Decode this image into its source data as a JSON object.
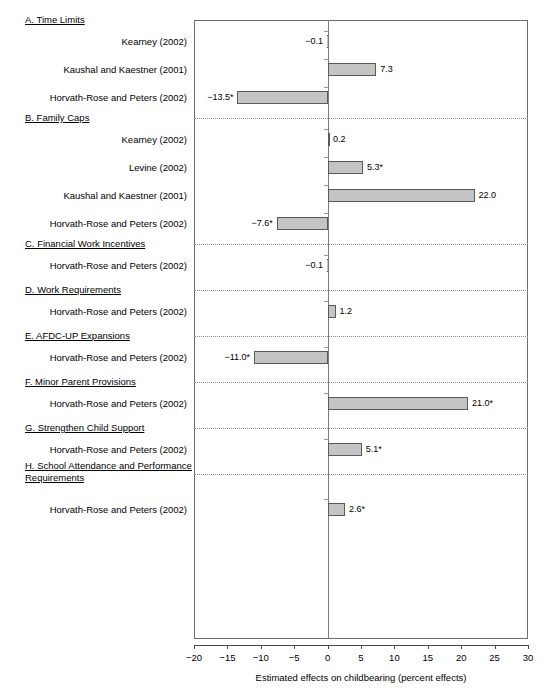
{
  "chart_data": {
    "type": "bar",
    "orientation": "horizontal",
    "title": "",
    "xlabel": "Estimated effects on childbearing (percent effects)",
    "ylabel": "",
    "xlim": [
      -20,
      30
    ],
    "xticks": [
      -20,
      -15,
      -10,
      -5,
      0,
      5,
      10,
      15,
      20,
      25,
      30
    ],
    "xtick_labels": [
      "−20",
      "−15",
      "−10",
      "−5",
      "0",
      "5",
      "10",
      "15",
      "20",
      "25",
      "30"
    ],
    "grid": false,
    "legend": "none",
    "zero_reference_line": true,
    "significance_marker": "*",
    "bar_fill_color": "#c4c4c4",
    "bar_edge_color": "#5a5a5a",
    "sections": [
      {
        "id": "A",
        "heading": "A. Time Limits",
        "heading_lines": [
          "A. Time Limits"
        ],
        "items": [
          {
            "label": "Kearney (2002)",
            "value": -0.1,
            "value_label": "−0.1",
            "significant": false
          },
          {
            "label": "Kaushal and Kaestner (2001)",
            "value": 7.3,
            "value_label": "7.3",
            "significant": false
          },
          {
            "label": "Horvath-Rose and Peters (2002)",
            "value": -13.5,
            "value_label": "−13.5*",
            "significant": true
          }
        ]
      },
      {
        "id": "B",
        "heading": "B. Family Caps",
        "heading_lines": [
          "B. Family Caps"
        ],
        "items": [
          {
            "label": "Kearney (2002)",
            "value": 0.2,
            "value_label": "0.2",
            "significant": false
          },
          {
            "label": "Levine (2002)",
            "value": 5.3,
            "value_label": "5.3*",
            "significant": true
          },
          {
            "label": "Kaushal and Kaestner (2001)",
            "value": 22.0,
            "value_label": "22.0",
            "significant": false
          },
          {
            "label": "Horvath-Rose and Peters (2002)",
            "value": -7.6,
            "value_label": "−7.6*",
            "significant": true
          }
        ]
      },
      {
        "id": "C",
        "heading": "C. Financial Work Incentives",
        "heading_lines": [
          "C. Financial Work Incentives"
        ],
        "items": [
          {
            "label": "Horvath-Rose and Peters (2002)",
            "value": -0.1,
            "value_label": "−0.1",
            "significant": false
          }
        ]
      },
      {
        "id": "D",
        "heading": "D. Work Requirements",
        "heading_lines": [
          "D. Work Requirements"
        ],
        "items": [
          {
            "label": "Horvath-Rose and Peters (2002)",
            "value": 1.2,
            "value_label": "1.2",
            "significant": false
          }
        ]
      },
      {
        "id": "E",
        "heading": "E. AFDC-UP Expansions",
        "heading_lines": [
          "E. AFDC-UP Expansions"
        ],
        "items": [
          {
            "label": "Horvath-Rose and Peters (2002)",
            "value": -11.0,
            "value_label": "−11.0*",
            "significant": true
          }
        ]
      },
      {
        "id": "F",
        "heading": "F. Minor Parent Provisions",
        "heading_lines": [
          "F. Minor Parent Provisions"
        ],
        "items": [
          {
            "label": "Horvath-Rose and Peters (2002)",
            "value": 21.0,
            "value_label": "21.0*",
            "significant": true
          }
        ]
      },
      {
        "id": "G",
        "heading": "G. Strengthen Child Support",
        "heading_lines": [
          "G. Strengthen Child Support"
        ],
        "items": [
          {
            "label": "Horvath-Rose and Peters (2002)",
            "value": 5.1,
            "value_label": "5.1*",
            "significant": true
          }
        ]
      },
      {
        "id": "H",
        "heading": "H. School Attendance and Performance Requirements",
        "heading_lines": [
          "H. School Attendance and Performance",
          "Requirements"
        ],
        "items": [
          {
            "label": "Horvath-Rose and Peters (2002)",
            "value": 2.6,
            "value_label": "2.6*",
            "significant": true
          }
        ]
      }
    ]
  }
}
